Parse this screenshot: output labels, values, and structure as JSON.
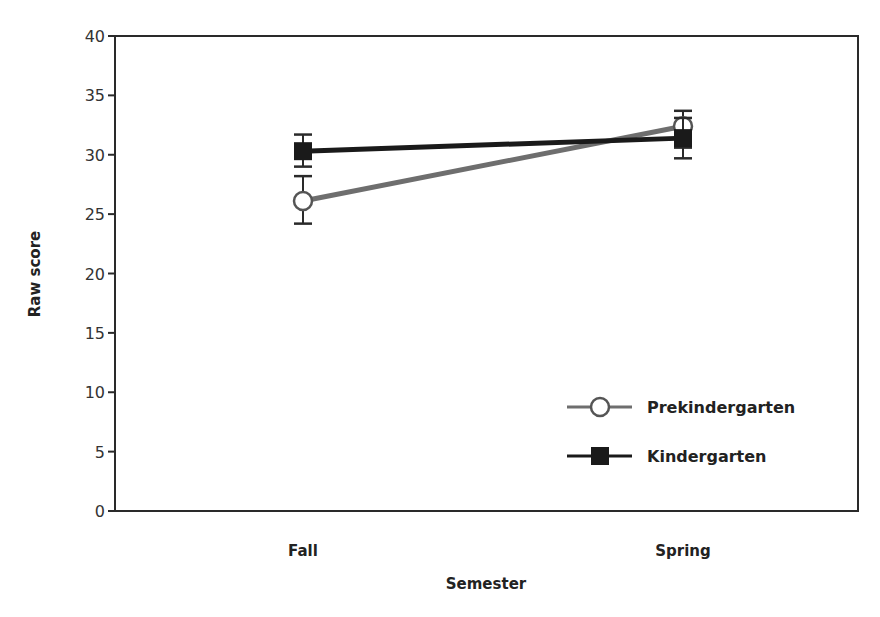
{
  "chart_data": {
    "type": "line",
    "title": "",
    "xlabel": "Semester",
    "ylabel": "Raw score",
    "categories": [
      "Fall",
      "Spring"
    ],
    "ylim": [
      0,
      40
    ],
    "yticks": [
      0,
      5,
      10,
      15,
      20,
      25,
      30,
      35,
      40
    ],
    "grid": false,
    "legend_position": "lower right inside",
    "series": [
      {
        "name": "Prekindergarten",
        "marker": "open-circle",
        "color": "#6e6e6e",
        "values": [
          26.1,
          32.4
        ],
        "error_low": [
          24.2,
          30.6
        ],
        "error_high": [
          28.2,
          33.7
        ]
      },
      {
        "name": "Kindergarten",
        "marker": "filled-square",
        "color": "#1a1a1a",
        "values": [
          30.3,
          31.4
        ],
        "error_low": [
          29.0,
          29.7
        ],
        "error_high": [
          31.7,
          33.1
        ]
      }
    ]
  }
}
